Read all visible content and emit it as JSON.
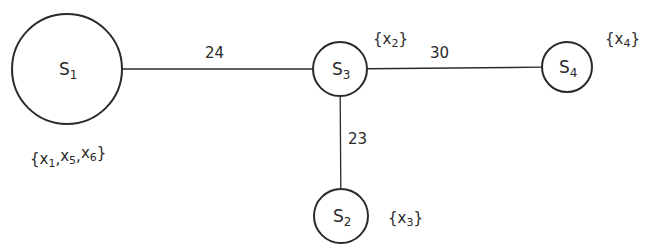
{
  "diagram": {
    "type": "weighted-graph",
    "nodes": [
      {
        "id": "S1",
        "base": "S",
        "sub": "1",
        "cx": 67,
        "cy": 69,
        "r": 55,
        "set": {
          "text": "{x1,x5,x6}",
          "items": [
            "x1",
            "x5",
            "x6"
          ],
          "x": 30,
          "y": 164
        }
      },
      {
        "id": "S3",
        "base": "S",
        "sub": "3",
        "cx": 340,
        "cy": 69,
        "r": 27,
        "set": {
          "text": "{x2}",
          "items": [
            "x2"
          ],
          "x": 373,
          "y": 44
        }
      },
      {
        "id": "S4",
        "base": "S",
        "sub": "4",
        "cx": 567,
        "cy": 67,
        "r": 25,
        "set": {
          "text": "{x4}",
          "items": [
            "x4"
          ],
          "x": 605,
          "y": 44
        }
      },
      {
        "id": "S2",
        "base": "S",
        "sub": "2",
        "cx": 341,
        "cy": 216,
        "r": 27,
        "set": {
          "text": "{x3}",
          "items": [
            "x3"
          ],
          "x": 388,
          "y": 223
        }
      }
    ],
    "edges": [
      {
        "from": "S1",
        "to": "S3",
        "weight": "24",
        "label_x": 205,
        "label_y": 58
      },
      {
        "from": "S3",
        "to": "S4",
        "weight": "30",
        "label_x": 430,
        "label_y": 58
      },
      {
        "from": "S3",
        "to": "S2",
        "weight": "23",
        "label_x": 348,
        "label_y": 144
      }
    ],
    "colors": {
      "stroke": "#2a2a2a",
      "background": "#ffffff"
    }
  }
}
